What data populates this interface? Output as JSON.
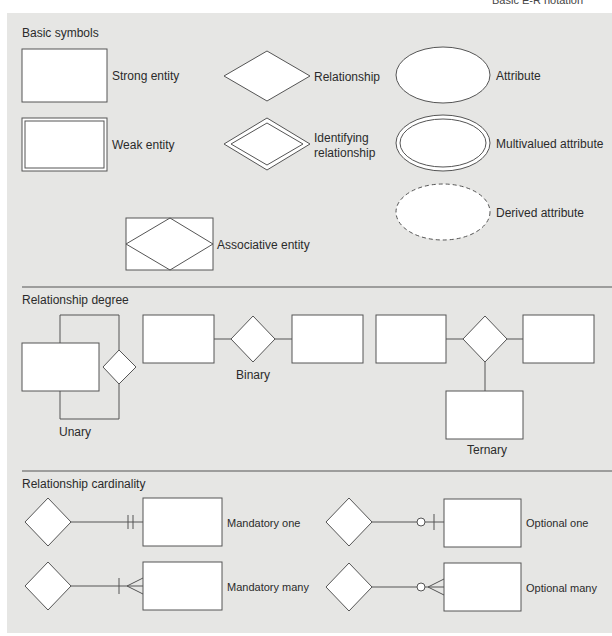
{
  "header": {
    "title": "Basic E-R notation"
  },
  "sections": {
    "basic": {
      "title": "Basic symbols",
      "items": [
        {
          "shape": "rectangle",
          "label": "Strong entity"
        },
        {
          "shape": "double-rectangle",
          "label": "Weak entity"
        },
        {
          "shape": "diamond",
          "label": "Relationship"
        },
        {
          "shape": "double-diamond",
          "label_line1": "Identifying",
          "label_line2": "relationship"
        },
        {
          "shape": "ellipse",
          "label": "Attribute"
        },
        {
          "shape": "double-ellipse",
          "label": "Multivalued attribute"
        },
        {
          "shape": "dashed-ellipse",
          "label": "Derived attribute"
        },
        {
          "shape": "rectangle-with-diamond",
          "label": "Associative entity"
        }
      ]
    },
    "degree": {
      "title": "Relationship degree",
      "items": [
        {
          "type": "unary",
          "label": "Unary"
        },
        {
          "type": "binary",
          "label": "Binary"
        },
        {
          "type": "ternary",
          "label": "Ternary"
        }
      ]
    },
    "cardinality": {
      "title": "Relationship cardinality",
      "items": [
        {
          "notation": "two-bars",
          "label": "Mandatory one"
        },
        {
          "notation": "bar-crowsfoot",
          "label": "Mandatory many"
        },
        {
          "notation": "circle-bar",
          "label": "Optional one"
        },
        {
          "notation": "circle-crowsfoot",
          "label": "Optional many"
        }
      ]
    }
  },
  "colors": {
    "panel": "#e6e6e4",
    "stroke": "#555555",
    "fill": "#ffffff"
  }
}
